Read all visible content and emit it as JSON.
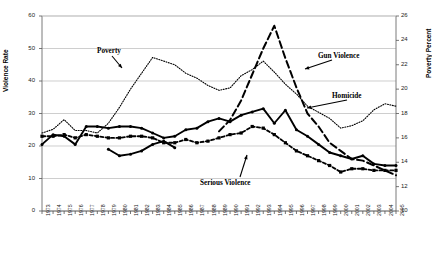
{
  "chart_data": {
    "type": "line",
    "title": "",
    "xlabel": "",
    "ylabel": "Violence Rate",
    "y2label": "Poverty Percent",
    "ylim": [
      0,
      60
    ],
    "y2lim": [
      10,
      26
    ],
    "grid": true,
    "legend_position": "inline-annotations",
    "x": [
      1973,
      1974,
      1975,
      1976,
      1977,
      1978,
      1979,
      1980,
      1981,
      1982,
      1983,
      1984,
      1985,
      1986,
      1987,
      1988,
      1989,
      1990,
      1991,
      1992,
      1993,
      1994,
      1995,
      1996,
      1997,
      1998,
      1999,
      2000,
      2001,
      2002,
      2003,
      2004,
      2005
    ],
    "yticks": [
      0,
      10,
      20,
      30,
      40,
      50,
      60
    ],
    "y2ticks": [
      10,
      12,
      14,
      16,
      18,
      20,
      22,
      24,
      26
    ],
    "xticklabels": [
      "1973",
      "1974",
      "1975",
      "1976",
      "1977",
      "1978",
      "1979",
      "1980",
      "1981",
      "1982",
      "1983",
      "1984",
      "1985",
      "1986",
      "1987",
      "1988",
      "1989",
      "1990",
      "1991",
      "1992",
      "1993",
      "1994",
      "1995",
      "1996",
      "1997",
      "1998",
      "1999",
      "2000",
      "2001",
      "2002",
      "2003",
      "2004",
      "2005"
    ],
    "series": [
      {
        "name": "Poverty",
        "axis": "right",
        "style": "fine-dotted",
        "marker": "none",
        "color": "#000000",
        "values": [
          16.4,
          16.7,
          17.5,
          16.6,
          16.6,
          16.4,
          17.2,
          18.5,
          20.0,
          21.3,
          22.6,
          22.3,
          22.0,
          21.3,
          20.9,
          20.3,
          19.9,
          20.1,
          21.1,
          21.6,
          22.3,
          21.4,
          20.4,
          19.6,
          18.6,
          18.1,
          17.6,
          16.8,
          17.0,
          17.4,
          18.3,
          18.8,
          18.6
        ],
        "values_left_axis_equivalent": [
          21,
          24,
          28,
          25,
          25,
          24,
          27,
          31,
          38,
          44,
          46,
          45,
          43,
          40,
          39,
          37,
          36,
          36,
          41,
          44,
          46,
          42,
          38,
          35,
          33,
          31,
          30,
          27,
          28,
          29,
          33,
          35,
          34
        ]
      },
      {
        "name": "Gun Violence",
        "axis": "left",
        "style": "long-dashed",
        "marker": "none",
        "color": "#000000",
        "values": [
          null,
          null,
          null,
          null,
          null,
          null,
          null,
          null,
          null,
          null,
          null,
          null,
          null,
          null,
          null,
          null,
          24.5,
          28.0,
          34.0,
          42.0,
          50.0,
          57.0,
          47.0,
          38.0,
          30.0,
          26.0,
          21.0,
          18.5,
          16.0,
          15.5,
          14.0,
          12.5,
          11.0
        ]
      },
      {
        "name": "Homicide",
        "axis": "left",
        "style": "solid",
        "marker": "dot",
        "color": "#000000",
        "values": [
          20.5,
          23.5,
          23.0,
          20.5,
          26.0,
          26.0,
          25.5,
          26.0,
          26.0,
          25.5,
          24.0,
          22.5,
          23.0,
          25.0,
          25.5,
          27.5,
          28.5,
          27.5,
          29.5,
          30.5,
          31.5,
          27.0,
          31.0,
          25.0,
          23.0,
          20.5,
          18.0,
          17.0,
          16.0,
          17.0,
          14.5,
          14.0,
          14.0
        ]
      },
      {
        "name": "Serious Violence",
        "axis": "left",
        "style": "dashed",
        "marker": "square",
        "color": "#000000",
        "values": [
          23.0,
          23.0,
          23.5,
          22.5,
          23.5,
          23.0,
          22.5,
          22.5,
          23.0,
          23.0,
          22.5,
          21.0,
          21.0,
          22.0,
          21.0,
          21.5,
          22.5,
          23.5,
          24.0,
          26.0,
          25.5,
          23.5,
          21.0,
          18.5,
          17.0,
          15.5,
          14.0,
          12.0,
          13.0,
          13.0,
          12.5,
          12.5,
          12.5
        ]
      },
      {
        "name": "Serious Violence Lower",
        "axis": "left",
        "style": "solid",
        "marker": "dot",
        "color": "#000000",
        "values": [
          null,
          null,
          null,
          null,
          null,
          null,
          19.0,
          17.0,
          17.5,
          18.5,
          20.5,
          21.5,
          19.5,
          null,
          null,
          null,
          null,
          null,
          null,
          null,
          null,
          null,
          null,
          null,
          null,
          null,
          null,
          null,
          null,
          null,
          null,
          null,
          null
        ]
      }
    ],
    "annotations": [
      {
        "name": "Poverty",
        "text": "Poverty"
      },
      {
        "name": "Gun Violence",
        "text": "Gun Violence"
      },
      {
        "name": "Homicide",
        "text": "Homicide"
      },
      {
        "name": "Serious Violence",
        "text": "Serious Violence"
      }
    ]
  },
  "axes": {
    "left_title": "Violence Rate",
    "right_title": "Poverty Percent"
  },
  "labels": {
    "poverty": "Poverty",
    "gun_violence": "Gun Violence",
    "homicide": "Homicide",
    "serious_violence": "Serious Violence"
  }
}
